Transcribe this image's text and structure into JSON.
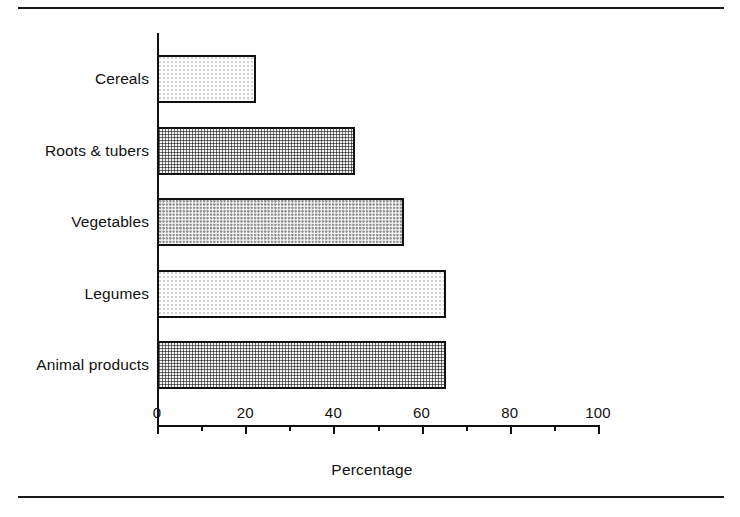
{
  "figure": {
    "has_top_rule": true,
    "has_bottom_rule": true,
    "rule_color": "#1a1a1a",
    "background": "#ffffff"
  },
  "axis": {
    "x_title": "Percentage",
    "tick_labels": [
      "0",
      "20",
      "40",
      "60",
      "80",
      "100"
    ]
  },
  "chart_data": {
    "type": "bar",
    "orientation": "horizontal",
    "title": "",
    "subtitle": "",
    "xlabel": "Percentage",
    "ylabel": "",
    "xlim": [
      0,
      100
    ],
    "xticks": [
      0,
      20,
      40,
      60,
      80,
      100
    ],
    "minor_xticks": [
      10,
      30,
      50,
      70,
      90
    ],
    "grid": false,
    "legend": false,
    "categories": [
      "Cereals",
      "Roots & tubers",
      "Vegetables",
      "Legumes",
      "Animal products"
    ],
    "values": [
      22.5,
      45.0,
      56.0,
      65.5,
      65.5
    ],
    "series": [
      {
        "name": "Percentage",
        "values": [
          22.5,
          45.0,
          56.0,
          65.5,
          65.5
        ]
      }
    ],
    "bar_fills": [
      "light-stipple",
      "dense-stipple",
      "medium-stipple",
      "light-stipple",
      "dense-stipple"
    ],
    "bar_edge_color": "#111111"
  }
}
